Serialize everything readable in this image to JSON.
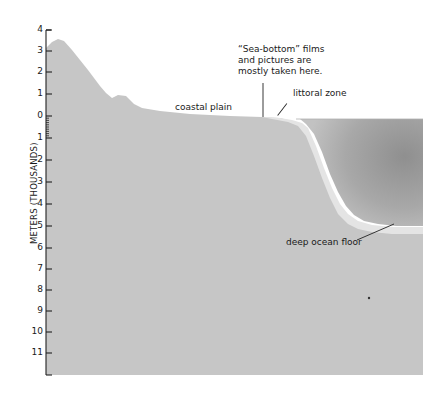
{
  "diagram": {
    "axis_title": "METERS (THOUSANDS)",
    "ticks": [
      {
        "label": "4",
        "y": 30
      },
      {
        "label": "3",
        "y": 51
      },
      {
        "label": "2",
        "y": 72
      },
      {
        "label": "1",
        "y": 94
      },
      {
        "label": "0",
        "y": 116
      },
      {
        "label": "1",
        "y": 138
      },
      {
        "label": "2",
        "y": 160
      },
      {
        "label": "3",
        "y": 182
      },
      {
        "label": "4",
        "y": 204
      },
      {
        "label": "5",
        "y": 226
      },
      {
        "label": "6",
        "y": 248
      },
      {
        "label": "7",
        "y": 269
      },
      {
        "label": "8",
        "y": 290
      },
      {
        "label": "9",
        "y": 311
      },
      {
        "label": "10",
        "y": 332
      },
      {
        "label": "11",
        "y": 353
      }
    ],
    "labels": {
      "coastal_plain": "coastal plain",
      "sea_bottom_line1": "“Sea-bottom” films",
      "sea_bottom_line2": "and pictures are",
      "sea_bottom_line3": "mostly taken here.",
      "littoral_zone": "littoral zone",
      "deep_ocean_floor": "deep ocean floor"
    },
    "colors": {
      "land": "#c4c4c4",
      "ocean_dark": "#9a9a9a",
      "sediment": "#e2e2e2",
      "axis": "#222222"
    }
  }
}
